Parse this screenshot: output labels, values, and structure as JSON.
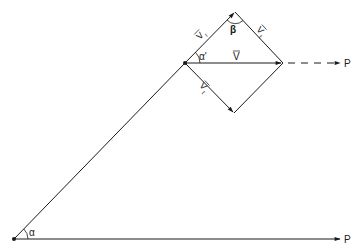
{
  "diagram": {
    "title": "",
    "line_color": "#1a1a1a",
    "nodes": {
      "origin": {
        "x": 14,
        "y": 239
      },
      "left_vertex": {
        "x": 185,
        "y": 63
      },
      "top_vertex": {
        "x": 235,
        "y": 12
      },
      "right_vertex": {
        "x": 283,
        "y": 63
      },
      "bottom_vertex": {
        "x": 234,
        "y": 113
      }
    },
    "labels": {
      "alpha": "α",
      "alpha_prime": "α'",
      "beta": "β",
      "v": "V",
      "v_r": "V",
      "v_r_sub": "r",
      "v_t_upper": "V",
      "v_t_upper_sub": "t",
      "v_t_lower": "V",
      "v_t_lower_sub": "t",
      "p_top": "P",
      "p_bottom": "P"
    }
  }
}
